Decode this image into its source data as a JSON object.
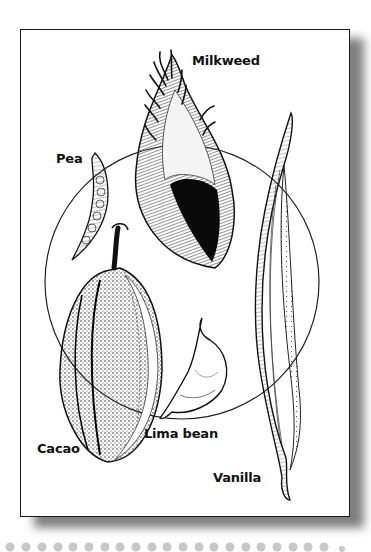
{
  "figure": {
    "type": "botanical illustration",
    "background_color": "#ffffff",
    "frame_border_color": "#1a1a1a",
    "shadow_color": "#6a6a6a",
    "dot_color": "#c8c8c8",
    "labels": {
      "milkweed": "Milkweed",
      "pea": "Pea",
      "cacao": "Cacao",
      "lima_bean": "Lima bean",
      "vanilla": "Vanilla"
    },
    "items": [
      {
        "name": "Milkweed",
        "description": "open seed pod with silky seeds"
      },
      {
        "name": "Pea",
        "description": "slender curved pod with beads"
      },
      {
        "name": "Cacao",
        "description": "ribbed stippled pod with stem"
      },
      {
        "name": "Lima bean",
        "description": "curved flat pod"
      },
      {
        "name": "Vanilla",
        "description": "long thin striated pod"
      }
    ],
    "dot_count": 21
  }
}
